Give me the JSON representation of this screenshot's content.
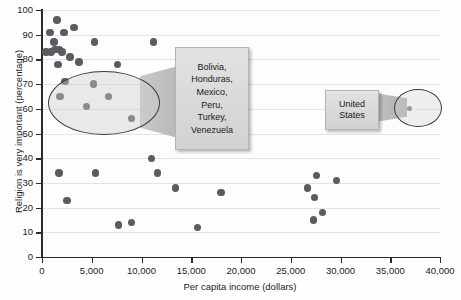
{
  "chart_data": {
    "type": "scatter",
    "title": "",
    "xlabel": "Per capita income (dollars)",
    "ylabel": "Religion is very important (percentage)",
    "xlim": [
      0,
      40000
    ],
    "ylim": [
      0,
      100
    ],
    "xticks": [
      "0",
      "5,000",
      "10,000",
      "15,000",
      "20,000",
      "25,000",
      "30,000",
      "35,000",
      "40,000"
    ],
    "xtick_values": [
      0,
      5000,
      10000,
      15000,
      20000,
      25000,
      30000,
      35000,
      40000
    ],
    "yticks": [
      "0",
      "10",
      "20",
      "30",
      "40",
      "50",
      "60",
      "70",
      "80",
      "90",
      "100"
    ],
    "ytick_values": [
      0,
      10,
      20,
      30,
      40,
      50,
      60,
      70,
      80,
      90,
      100
    ],
    "grid": "horizontal",
    "legend": "none",
    "marker_color": "#5b5b62",
    "points": [
      {
        "x": 1500,
        "y": 96
      },
      {
        "x": 800,
        "y": 91
      },
      {
        "x": 2200,
        "y": 91
      },
      {
        "x": 3200,
        "y": 93
      },
      {
        "x": 1200,
        "y": 87
      },
      {
        "x": 5300,
        "y": 87
      },
      {
        "x": 400,
        "y": 83
      },
      {
        "x": 900,
        "y": 83
      },
      {
        "x": 1300,
        "y": 84
      },
      {
        "x": 1700,
        "y": 84
      },
      {
        "x": 2000,
        "y": 83
      },
      {
        "x": 2800,
        "y": 81
      },
      {
        "x": 1600,
        "y": 78
      },
      {
        "x": 3700,
        "y": 79
      },
      {
        "x": 11200,
        "y": 87
      },
      {
        "x": 7600,
        "y": 78
      },
      {
        "x": 2300,
        "y": 71
      },
      {
        "x": 5200,
        "y": 70
      },
      {
        "x": 1800,
        "y": 65
      },
      {
        "x": 6700,
        "y": 65
      },
      {
        "x": 4500,
        "y": 61
      },
      {
        "x": 9000,
        "y": 56
      },
      {
        "x": 11000,
        "y": 40
      },
      {
        "x": 11600,
        "y": 34
      },
      {
        "x": 1700,
        "y": 34
      },
      {
        "x": 5400,
        "y": 34
      },
      {
        "x": 13400,
        "y": 28
      },
      {
        "x": 18000,
        "y": 26
      },
      {
        "x": 2500,
        "y": 23
      },
      {
        "x": 7700,
        "y": 13
      },
      {
        "x": 9000,
        "y": 14
      },
      {
        "x": 15600,
        "y": 12
      },
      {
        "x": 27600,
        "y": 33
      },
      {
        "x": 29600,
        "y": 31
      },
      {
        "x": 26700,
        "y": 28
      },
      {
        "x": 27400,
        "y": 24
      },
      {
        "x": 28200,
        "y": 18
      },
      {
        "x": 27300,
        "y": 15
      },
      {
        "x": 36900,
        "y": 60
      }
    ],
    "annotations": [
      {
        "name": "cluster-callout",
        "label": "Bolivia,\nHonduras,\nMexico,\nPeru,\nTurkey,\nVenezuela",
        "lines": [
          "Bolivia,",
          "Honduras,",
          "Mexico,",
          "Peru,",
          "Turkey,",
          "Venezuela"
        ]
      },
      {
        "name": "united-states-callout",
        "lines": [
          "United",
          "States"
        ]
      }
    ]
  },
  "axes": {
    "y_title": "Religion is very important (percentage)",
    "x_title": "Per capita income (dollars)"
  },
  "callouts": {
    "cluster": {
      "line1": "Bolivia,",
      "line2": "Honduras,",
      "line3": "Mexico,",
      "line4": "Peru,",
      "line5": "Turkey,",
      "line6": "Venezuela"
    },
    "united_states": {
      "line1": "United",
      "line2": "States"
    }
  },
  "colors": {
    "marker": "#5b5b62",
    "axis": "#2b2b2b",
    "gridline": "#e4e4e4",
    "callout_fill": "#dcdcdc",
    "ellipse_stroke": "#3a3a3a"
  }
}
